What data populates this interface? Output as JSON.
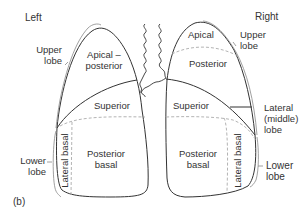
{
  "figure": {
    "panel_label": "(b)",
    "side_labels": {
      "left": "Left",
      "right": "Right"
    },
    "left_lung": {
      "lobes": [
        {
          "name": "Upper lobe",
          "line1": "Upper",
          "line2": "lobe"
        },
        {
          "name": "Lower lobe",
          "line1": "Lower",
          "line2": "lobe"
        }
      ],
      "segments": {
        "apical_posterior": {
          "line1": "Apical –",
          "line2": "posterior"
        },
        "superior": "Superior",
        "lateral_basal": "Lateral basal",
        "posterior_basal": {
          "line1": "Posterior",
          "line2": "basal"
        }
      }
    },
    "right_lung": {
      "lobes": [
        {
          "name": "Upper lobe",
          "line1": "Upper",
          "line2": "lobe"
        },
        {
          "name": "Lateral (middle) lobe",
          "line1": "Lateral",
          "line2": "(middle)",
          "line3": "lobe"
        },
        {
          "name": "Lower lobe",
          "line1": "Lower",
          "line2": "lobe"
        }
      ],
      "segments": {
        "apical": "Apical",
        "posterior": "Posterior",
        "superior": "Superior",
        "lateral_basal": "Lateral basal",
        "posterior_basal": {
          "line1": "Posterior",
          "line2": "basal"
        }
      }
    },
    "colors": {
      "outline": "#333333",
      "dashed": "#aaaaaa",
      "bracket": "#888888",
      "text": "#333333"
    }
  }
}
